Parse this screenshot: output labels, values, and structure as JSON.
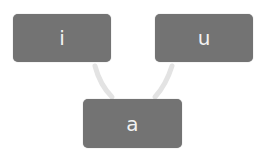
{
  "diagram": {
    "nodes": [
      {
        "id": "i",
        "label": "i"
      },
      {
        "id": "u",
        "label": "u"
      },
      {
        "id": "a",
        "label": "a"
      }
    ],
    "edges": [
      {
        "from": "i",
        "to": "a"
      },
      {
        "from": "u",
        "to": "a"
      }
    ],
    "colors": {
      "node_fill": "#737373",
      "node_text": "#f2f2f2",
      "connector": "#e6e6e6"
    }
  }
}
